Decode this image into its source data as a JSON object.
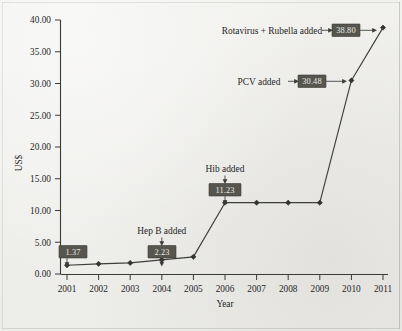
{
  "chart_data": {
    "type": "line",
    "title": "",
    "xlabel": "Year",
    "ylabel": "US$",
    "x": [
      2001,
      2002,
      2003,
      2004,
      2005,
      2006,
      2007,
      2008,
      2009,
      2010,
      2011
    ],
    "categories": [
      "2001",
      "2002",
      "2003",
      "2004",
      "2005",
      "2006",
      "2007",
      "2008",
      "2009",
      "2010",
      "2011"
    ],
    "values": [
      1.37,
      1.6,
      1.75,
      2.23,
      2.7,
      11.23,
      11.23,
      11.23,
      11.23,
      30.48,
      38.8
    ],
    "series": [
      {
        "name": "Vaccine cost per child",
        "values": [
          1.37,
          1.6,
          1.75,
          2.23,
          2.7,
          11.23,
          11.23,
          11.23,
          11.23,
          30.48,
          38.8
        ]
      }
    ],
    "ylim": [
      0.0,
      40.0
    ],
    "xlim": [
      2001,
      2011
    ],
    "yticks": [
      "0.00",
      "5.00",
      "10.00",
      "15.00",
      "20.00",
      "25.00",
      "30.00",
      "35.00",
      "40.00"
    ],
    "ytick_values": [
      0,
      5,
      10,
      15,
      20,
      25,
      30,
      35,
      40
    ],
    "xticks": [
      "2001",
      "2002",
      "2003",
      "2004",
      "2005",
      "2006",
      "2007",
      "2008",
      "2009",
      "2010",
      "2011"
    ],
    "grid": false,
    "legend": false,
    "legend_position": "none",
    "marker": "diamond",
    "annotations": [
      {
        "label": "1.37",
        "value": 1.37,
        "year": 2001,
        "note": "",
        "style": "value-box-above"
      },
      {
        "label": "2.23",
        "value": 2.23,
        "year": 2004,
        "note": "Hep B added",
        "style": "value-box-above-with-note"
      },
      {
        "label": "11.23",
        "value": 11.23,
        "year": 2006,
        "note": "Hib added",
        "style": "value-box-above-with-note"
      },
      {
        "label": "30.48",
        "value": 30.48,
        "year": 2010,
        "note": "PCV added",
        "style": "value-box-left-with-note"
      },
      {
        "label": "38.80",
        "value": 38.8,
        "year": 2011,
        "note": "Rotavirus + Rubella added",
        "style": "value-box-left-with-note"
      }
    ]
  },
  "colors": {
    "background": "#eeeeec",
    "line": "#3d3d3a",
    "marker": "#33332f",
    "axis": "#3a3a38",
    "text": "#25251f",
    "value_box_fill": "#56564f",
    "value_box_text": "#e9e9e4"
  },
  "axis": {
    "y_title": "US$",
    "x_title": "Year"
  },
  "annotation_labels": {
    "hep_b": "Hep B added",
    "hib": "Hib added",
    "pcv": "PCV added",
    "rota_rubella": "Rotavirus + Rubella added"
  },
  "value_labels": {
    "v2001": "1.37",
    "v2004": "2.23",
    "v2006": "11.23",
    "v2010": "30.48",
    "v2011": "38.80"
  }
}
